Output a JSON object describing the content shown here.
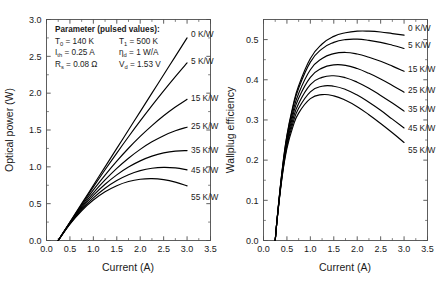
{
  "figure": {
    "panels": [
      "left",
      "right"
    ]
  },
  "annotation": {
    "title": "Parameter (pulsed values):",
    "lines": [
      [
        {
          "sym": "T",
          "sub": "0",
          "rest": " =  140 K"
        },
        {
          "sym": "T",
          "sub": "1",
          "rest": " = 500 K"
        }
      ],
      [
        {
          "sym": "I",
          "sub": "th",
          "rest": " =  0.25 A"
        },
        {
          "sym": "η",
          "sub": "d",
          "rest": " = 1 W/A"
        }
      ],
      [
        {
          "sym": "R",
          "sub": "s",
          "rest": " = 0.08 Ω"
        },
        {
          "sym": "V",
          "sub": "d",
          "rest": " = 1.53 V"
        }
      ]
    ]
  },
  "curve_labels": [
    "0 K/W",
    "5 K/W",
    "15 K/W",
    "25 K/W",
    "35 K/W",
    "45 K/W",
    "55 K/W"
  ],
  "chart_data": [
    {
      "type": "line",
      "panel": "left",
      "title": "",
      "xlabel": "Current  (A)",
      "ylabel": "Optical power  (W)",
      "xlim": [
        0.0,
        3.5
      ],
      "ylim": [
        0.0,
        3.0
      ],
      "xticks": [
        "0.0",
        "0.5",
        "1.0",
        "1.5",
        "2.0",
        "2.5",
        "3.0",
        "3.5"
      ],
      "yticks": [
        "0.0",
        "0.5",
        "1.0",
        "1.5",
        "2.0",
        "2.5",
        "3.0"
      ],
      "xtick_values": [
        0.0,
        0.5,
        1.0,
        1.5,
        2.0,
        2.5,
        3.0,
        3.5
      ],
      "ytick_values": [
        0.0,
        0.5,
        1.0,
        1.5,
        2.0,
        2.5,
        3.0
      ],
      "grid": false,
      "legend_position": "inline-right-of-curve-ends",
      "x": [
        0.25,
        0.5,
        0.75,
        1.0,
        1.25,
        1.5,
        1.75,
        2.0,
        2.25,
        2.5,
        2.75,
        3.0
      ],
      "series": [
        {
          "name": "0 K/W",
          "thermal_resistance": 0,
          "values": [
            0.0,
            0.25,
            0.5,
            0.75,
            1.0,
            1.25,
            1.5,
            1.75,
            2.0,
            2.25,
            2.5,
            2.75
          ],
          "label_at": [
            3.0,
            2.75
          ]
        },
        {
          "name": "5 K/W",
          "thermal_resistance": 5,
          "values": [
            0.0,
            0.247,
            0.489,
            0.727,
            0.96,
            1.187,
            1.408,
            1.623,
            1.831,
            2.032,
            2.226,
            2.412
          ],
          "label_at": [
            3.0,
            2.41
          ]
        },
        {
          "name": "15 K/W",
          "thermal_resistance": 15,
          "values": [
            0.0,
            0.242,
            0.47,
            0.686,
            0.888,
            1.077,
            1.252,
            1.413,
            1.56,
            1.693,
            1.812,
            1.917
          ],
          "label_at": [
            3.0,
            1.92
          ]
        },
        {
          "name": "25 K/W",
          "thermal_resistance": 25,
          "values": [
            0.0,
            0.237,
            0.452,
            0.647,
            0.822,
            0.979,
            1.117,
            1.237,
            1.339,
            1.423,
            1.489,
            1.538
          ],
          "label_at": [
            3.0,
            1.54
          ]
        },
        {
          "name": "35 K/W",
          "thermal_resistance": 35,
          "values": [
            0.0,
            0.232,
            0.435,
            0.612,
            0.763,
            0.891,
            0.997,
            1.081,
            1.145,
            1.189,
            1.214,
            1.22
          ],
          "label_at": [
            3.0,
            1.22
          ]
        },
        {
          "name": "45 K/W",
          "thermal_resistance": 45,
          "values": [
            0.0,
            0.227,
            0.419,
            0.579,
            0.71,
            0.814,
            0.893,
            0.948,
            0.981,
            0.993,
            0.985,
            0.958
          ],
          "label_at": [
            3.0,
            0.96
          ]
        },
        {
          "name": "55 K/W",
          "thermal_resistance": 55,
          "values": [
            0.0,
            0.222,
            0.404,
            0.549,
            0.661,
            0.744,
            0.8,
            0.831,
            0.839,
            0.826,
            0.793,
            0.742
          ],
          "label_at": [
            3.0,
            0.74
          ]
        }
      ]
    },
    {
      "type": "line",
      "panel": "right",
      "title": "",
      "xlabel": "Current  (A)",
      "ylabel": "Wallplug efficiency",
      "xlim": [
        0.0,
        3.5
      ],
      "ylim": [
        0.0,
        0.55
      ],
      "xticks": [
        "0.0",
        "0.5",
        "1.0",
        "1.5",
        "2.0",
        "2.5",
        "3.0",
        "3.5"
      ],
      "yticks": [
        "0.0",
        "0.1",
        "0.2",
        "0.3",
        "0.4",
        "0.5"
      ],
      "xtick_values": [
        0.0,
        0.5,
        1.0,
        1.5,
        2.0,
        2.5,
        3.0,
        3.5
      ],
      "ytick_values": [
        0.0,
        0.1,
        0.2,
        0.3,
        0.4,
        0.5
      ],
      "grid": false,
      "legend_position": "inline-right-of-curve-ends",
      "x": [
        0.25,
        0.3,
        0.4,
        0.5,
        0.625,
        0.75,
        1.0,
        1.25,
        1.5,
        1.75,
        2.0,
        2.25,
        2.5,
        2.75,
        3.0
      ],
      "series": [
        {
          "name": "0 K/W",
          "thermal_resistance": 0,
          "values": [
            0.0,
            0.065,
            0.177,
            0.262,
            0.333,
            0.385,
            0.453,
            0.489,
            0.508,
            0.517,
            0.521,
            0.521,
            0.519,
            0.515,
            0.511
          ],
          "label_at": [
            3.0,
            0.511
          ]
        },
        {
          "name": "5 K/W",
          "thermal_resistance": 5,
          "values": [
            0.0,
            0.065,
            0.175,
            0.259,
            0.329,
            0.379,
            0.444,
            0.477,
            0.493,
            0.5,
            0.501,
            0.498,
            0.493,
            0.486,
            0.478
          ],
          "label_at": [
            3.0,
            0.478
          ]
        },
        {
          "name": "15 K/W",
          "thermal_resistance": 15,
          "values": [
            0.0,
            0.064,
            0.172,
            0.253,
            0.319,
            0.366,
            0.425,
            0.453,
            0.465,
            0.468,
            0.464,
            0.456,
            0.446,
            0.434,
            0.421
          ],
          "label_at": [
            3.0,
            0.421
          ]
        },
        {
          "name": "25 K/W",
          "thermal_resistance": 25,
          "values": [
            0.0,
            0.064,
            0.169,
            0.247,
            0.31,
            0.354,
            0.406,
            0.429,
            0.437,
            0.436,
            0.428,
            0.416,
            0.402,
            0.386,
            0.369
          ],
          "label_at": [
            3.0,
            0.369
          ]
        },
        {
          "name": "35 K/W",
          "thermal_resistance": 35,
          "values": [
            0.0,
            0.063,
            0.166,
            0.241,
            0.3,
            0.341,
            0.388,
            0.406,
            0.41,
            0.405,
            0.394,
            0.379,
            0.361,
            0.342,
            0.322
          ],
          "label_at": [
            3.0,
            0.322
          ]
        },
        {
          "name": "45 K/W",
          "thermal_resistance": 45,
          "values": [
            0.0,
            0.063,
            0.163,
            0.235,
            0.291,
            0.329,
            0.37,
            0.384,
            0.384,
            0.376,
            0.362,
            0.344,
            0.324,
            0.302,
            0.28
          ],
          "label_at": [
            3.0,
            0.28
          ]
        },
        {
          "name": "55 K/W",
          "thermal_resistance": 55,
          "values": [
            0.0,
            0.062,
            0.16,
            0.229,
            0.282,
            0.317,
            0.353,
            0.363,
            0.36,
            0.349,
            0.333,
            0.313,
            0.291,
            0.268,
            0.244
          ],
          "label_at": [
            3.0,
            0.244
          ]
        }
      ]
    }
  ]
}
